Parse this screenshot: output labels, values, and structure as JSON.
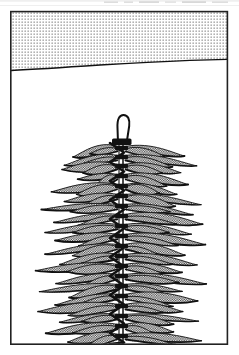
{
  "figure": {
    "kind": "botanical-line-drawing",
    "caption": "",
    "width": 239,
    "height": 355,
    "background_color": "#ffffff",
    "ink_color": "#111111",
    "stipple_color": "#4a4a4a"
  },
  "frame": {
    "name": "illustration-border",
    "left": 10,
    "top": 11,
    "right": 228,
    "bottom": 344,
    "stroke_color": "#222222",
    "stroke_width": 1.6
  },
  "substrate": {
    "label": "stippled-sediment-band",
    "description": "dotted halftone band across upper part of the frame",
    "fill_pattern": "dot-grid",
    "dot_color": "#3a3a3a",
    "dot_spacing_px": 3,
    "dot_radius_px": 0.55,
    "surface_line": {
      "label": "sediment-surface-line",
      "stroke_color": "#111111",
      "stroke_width": 1.4,
      "points": [
        [
          11,
          70.5
        ],
        [
          40,
          69.0
        ],
        [
          70,
          67.0
        ],
        [
          100,
          65.0
        ],
        [
          130,
          63.2
        ],
        [
          160,
          61.6
        ],
        [
          190,
          60.4
        ],
        [
          227,
          59.4
        ]
      ]
    },
    "top": 11,
    "bottom_left": 70.5,
    "bottom_right": 59.4
  },
  "plant": {
    "label": "whorled-aquatic-plant",
    "stem": {
      "label": "central-stem",
      "axis_x": 121.5,
      "top_y": 142,
      "bottom_y": 344,
      "stroke_color": "#111111",
      "stroke_width": 1.5
    },
    "zigzag": {
      "label": "zigzag-stem-overlay",
      "left_x": 110,
      "right_x": 124,
      "top_y": 143,
      "bottom_y": 344,
      "segment_height": 9.5,
      "stroke_color": "#111111",
      "stroke_width": 2.6
    },
    "apex_hook": {
      "label": "curled-apex-hook",
      "description": "slender curved hook at the growing tip above the topmost whorl",
      "stroke_color": "#111111",
      "stroke_width": 2.0,
      "path": "M 118 143 L 117.5 128 C 117.0 119.0 119.5 115.0 123.5 115.0 C 128.0 115.0 130.0 119.5 129.2 126.0 L 127.0 140.5"
    },
    "apex_node": {
      "label": "apex-node-collar",
      "x": 112,
      "y": 139,
      "width": 19,
      "height": 7,
      "fill_color": "#111111"
    },
    "whorls": [
      {
        "y": 148,
        "left_reach": 42,
        "right_reach": 54
      },
      {
        "y": 157,
        "left_reach": 52,
        "right_reach": 66
      },
      {
        "y": 166,
        "left_reach": 64,
        "right_reach": 58
      },
      {
        "y": 176,
        "left_reach": 46,
        "right_reach": 70
      },
      {
        "y": 186,
        "left_reach": 70,
        "right_reach": 52
      },
      {
        "y": 196,
        "left_reach": 54,
        "right_reach": 74
      },
      {
        "y": 206,
        "left_reach": 76,
        "right_reach": 60
      },
      {
        "y": 216,
        "left_reach": 58,
        "right_reach": 80
      },
      {
        "y": 226,
        "left_reach": 80,
        "right_reach": 64
      },
      {
        "y": 236,
        "left_reach": 62,
        "right_reach": 86
      },
      {
        "y": 246,
        "left_reach": 84,
        "right_reach": 58
      },
      {
        "y": 256,
        "left_reach": 56,
        "right_reach": 82
      },
      {
        "y": 266,
        "left_reach": 88,
        "right_reach": 66
      },
      {
        "y": 276,
        "left_reach": 66,
        "right_reach": 90
      },
      {
        "y": 286,
        "left_reach": 82,
        "right_reach": 60
      },
      {
        "y": 296,
        "left_reach": 58,
        "right_reach": 84
      },
      {
        "y": 306,
        "left_reach": 86,
        "right_reach": 62
      },
      {
        "y": 316,
        "left_reach": 60,
        "right_reach": 80
      },
      {
        "y": 326,
        "left_reach": 78,
        "right_reach": 56
      },
      {
        "y": 336,
        "left_reach": 54,
        "right_reach": 76
      }
    ],
    "leaf": {
      "label": "whorl-leaf",
      "outline_color": "#111111",
      "outline_width": 1.3,
      "shade_pattern": "checker-stipple",
      "shade_color": "#3c3c3c",
      "taper": "acuminate-tapering-to-fine-point"
    },
    "nodes": {
      "label": "stem-node-thickening",
      "fill_color": "#111111",
      "width": 13,
      "height": 4.5
    }
  }
}
